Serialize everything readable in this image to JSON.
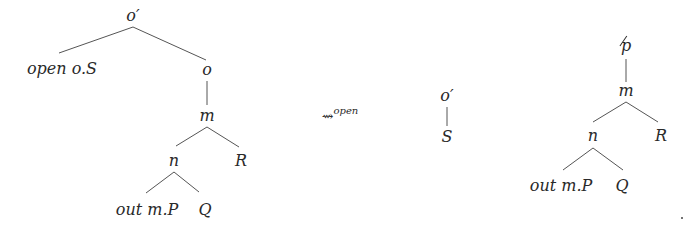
{
  "diagram": {
    "type": "tree-rewrite",
    "left_tree": {
      "root": "o′",
      "nodes": {
        "root": "o′",
        "left_leaf": "open o.S",
        "o": "o",
        "m": "m",
        "n": "n",
        "R": "R",
        "out": "out m.P",
        "Q": "Q"
      },
      "edges": [
        [
          "o′",
          "open o.S"
        ],
        [
          "o′",
          "o"
        ],
        [
          "o",
          "m"
        ],
        [
          "m",
          "n"
        ],
        [
          "m",
          "R"
        ],
        [
          "n",
          "out m.P"
        ],
        [
          "n",
          "Q"
        ]
      ]
    },
    "transition": {
      "symbol": "⇝",
      "label": "open"
    },
    "middle_tree": {
      "nodes": {
        "root": "o′",
        "child": "S"
      },
      "edges": [
        [
          "o′",
          "S"
        ]
      ]
    },
    "right_tree": {
      "nodes": {
        "root": "p",
        "m": "m",
        "n": "n",
        "R": "R",
        "out": "out m.P",
        "Q": "Q"
      },
      "edges": [
        [
          "p",
          "m"
        ],
        [
          "m",
          "n"
        ],
        [
          "m",
          "R"
        ],
        [
          "n",
          "out m.P"
        ],
        [
          "n",
          "Q"
        ]
      ]
    },
    "trailing_mark": "."
  }
}
